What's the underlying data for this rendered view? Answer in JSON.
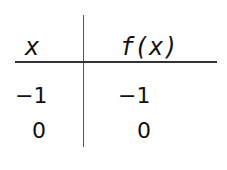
{
  "table": {
    "headers": [
      "x",
      "f(x)"
    ],
    "rows": [
      [
        "−1",
        "−1"
      ],
      [
        "0",
        "0"
      ]
    ]
  }
}
